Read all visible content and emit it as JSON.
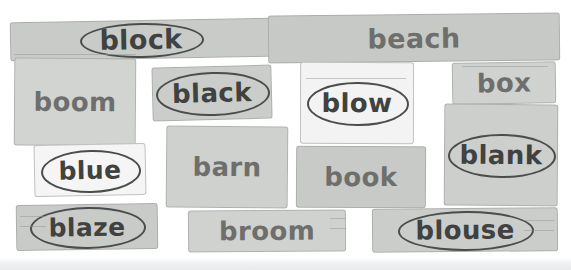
{
  "scene": {
    "title": "word-brick-wall",
    "description": "Photo of paper bricks each printed with a word; several words are circled",
    "background_color": "#ffffff",
    "bottom_band_color": "#e9eaec",
    "text_color": "#6e6f6d",
    "circled_text_color": "#3f4240",
    "ring_color": "#4a4d4b",
    "brick_edge_color": "#969896"
  },
  "bricks": [
    {
      "word": "block",
      "circled": true,
      "fill": "#c9cbc8",
      "x": 10,
      "y": 20,
      "w": 262,
      "h": 39,
      "rotate": -1.0,
      "font_size": 27
    },
    {
      "word": "beach",
      "circled": false,
      "fill": "#c7c9c6",
      "x": 268,
      "y": 14,
      "w": 292,
      "h": 48,
      "rotate": -0.6,
      "font_size": 27
    },
    {
      "word": "boom",
      "circled": false,
      "fill": "#d2d4d1",
      "x": 14,
      "y": 58,
      "w": 122,
      "h": 88,
      "rotate": 0.4,
      "font_size": 26
    },
    {
      "word": "black",
      "circled": true,
      "fill": "#cbcdca",
      "x": 152,
      "y": 66,
      "w": 120,
      "h": 54,
      "rotate": -1.4,
      "font_size": 26
    },
    {
      "word": "blow",
      "circled": true,
      "fill": "#f2f3f2",
      "x": 300,
      "y": 62,
      "w": 114,
      "h": 82,
      "rotate": 0.2,
      "font_size": 26
    },
    {
      "word": "box",
      "circled": false,
      "fill": "#d0d2cf",
      "x": 452,
      "y": 62,
      "w": 104,
      "h": 42,
      "rotate": -0.8,
      "font_size": 26
    },
    {
      "word": "blue",
      "circled": true,
      "fill": "#f4f5f4",
      "x": 34,
      "y": 144,
      "w": 112,
      "h": 52,
      "rotate": -1.2,
      "font_size": 25
    },
    {
      "word": "barn",
      "circled": false,
      "fill": "#cfd1ce",
      "x": 166,
      "y": 126,
      "w": 122,
      "h": 82,
      "rotate": 0.5,
      "font_size": 26
    },
    {
      "word": "book",
      "circled": false,
      "fill": "#c8cac7",
      "x": 296,
      "y": 146,
      "w": 130,
      "h": 62,
      "rotate": 0.3,
      "font_size": 26
    },
    {
      "word": "blank",
      "circled": true,
      "fill": "#cdcfcc",
      "x": 444,
      "y": 104,
      "w": 114,
      "h": 102,
      "rotate": 0.4,
      "font_size": 26
    },
    {
      "word": "blaze",
      "circled": true,
      "fill": "#c9cbc8",
      "x": 16,
      "y": 204,
      "w": 142,
      "h": 46,
      "rotate": -0.8,
      "font_size": 25
    },
    {
      "word": "broom",
      "circled": false,
      "fill": "#d0d2cf",
      "x": 188,
      "y": 210,
      "w": 158,
      "h": 42,
      "rotate": -0.4,
      "font_size": 26
    },
    {
      "word": "blouse",
      "circled": true,
      "fill": "#cbcdca",
      "x": 372,
      "y": 208,
      "w": 186,
      "h": 44,
      "rotate": -0.5,
      "font_size": 26
    }
  ],
  "seams": [
    {
      "x": 14,
      "y": 54,
      "w": 122
    },
    {
      "x": 462,
      "y": 66,
      "w": 86
    },
    {
      "x": 306,
      "y": 78,
      "w": 100
    },
    {
      "x": 20,
      "y": 216,
      "w": 26
    },
    {
      "x": 20,
      "y": 226,
      "w": 26
    },
    {
      "x": 330,
      "y": 218,
      "w": 16
    },
    {
      "x": 330,
      "y": 228,
      "w": 16
    },
    {
      "x": 524,
      "y": 220,
      "w": 30
    },
    {
      "x": 524,
      "y": 230,
      "w": 30
    }
  ]
}
